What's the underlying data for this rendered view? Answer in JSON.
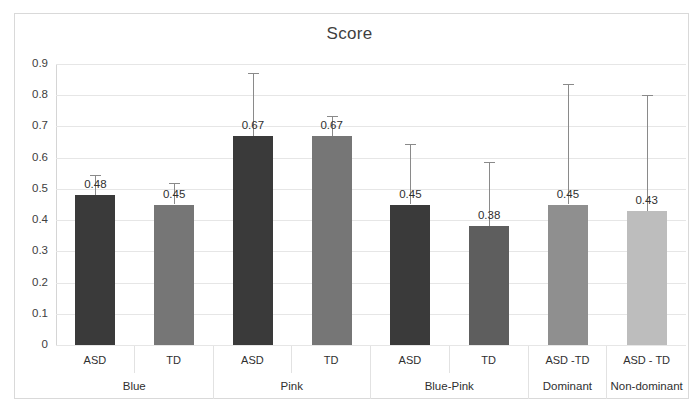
{
  "chart_data": {
    "type": "bar",
    "title": "Score",
    "xlabel": "",
    "ylabel": "",
    "ylim": [
      0,
      0.9
    ],
    "grid": true,
    "legend": "none",
    "ytick_labels": [
      "0.9",
      "0.8",
      "0.7",
      "0.6",
      "0.5",
      "0.4",
      "0.3",
      "0.2",
      "0.1",
      "0"
    ],
    "ytick_values": [
      0.9,
      0.8,
      0.7,
      0.6,
      0.5,
      0.4,
      0.3,
      0.2,
      0.1,
      0
    ],
    "categories": [
      "ASD",
      "TD",
      "ASD",
      "TD",
      "ASD",
      "TD",
      "ASD -TD",
      "ASD - TD"
    ],
    "groups": [
      {
        "label": "Blue",
        "span": 2
      },
      {
        "label": "Pink",
        "span": 2
      },
      {
        "label": "Blue-Pink",
        "span": 2
      },
      {
        "label": "Dominant",
        "span": 1
      },
      {
        "label": "Non-dominant",
        "span": 1
      }
    ],
    "values": [
      0.48,
      0.45,
      0.67,
      0.67,
      0.45,
      0.38,
      0.45,
      0.43
    ],
    "value_labels": [
      "0.48",
      "0.45",
      "0.67",
      "0.67",
      "0.45",
      "0.38",
      "0.45",
      "0.43"
    ],
    "error_upper": [
      0.545,
      0.52,
      0.87,
      0.735,
      0.645,
      0.585,
      0.835,
      0.8
    ],
    "bar_colors": [
      "#3a3a3a",
      "#767676",
      "#3a3a3a",
      "#767676",
      "#3a3a3a",
      "#5e5e5e",
      "#8f8f8f",
      "#bdbdbd"
    ],
    "colors": {
      "asd_dark": "#3a3a3a",
      "td_medium": "#767676",
      "dominant": "#8f8f8f",
      "non_dominant": "#bdbdbd",
      "gridline": "#e6e6e6",
      "error_bar": "#8a8a8a",
      "axis": "#bfbfbf",
      "text": "#2f2f2f",
      "frame": "#d9d9d9"
    }
  }
}
